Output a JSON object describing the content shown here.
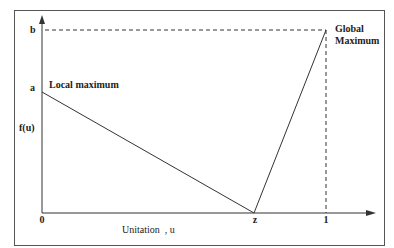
{
  "diagram": {
    "type": "fitness-landscape",
    "y_axis": {
      "label": "f(u)",
      "ticks": [
        {
          "label": "b",
          "value": "b"
        },
        {
          "label": "a",
          "value": "a"
        }
      ]
    },
    "x_axis": {
      "label": "Unitation  , u",
      "ticks": [
        {
          "label": "0",
          "value": 0
        },
        {
          "label": "z",
          "value": "z"
        },
        {
          "label": "1",
          "value": 1
        }
      ]
    },
    "annotations": {
      "local_max": "Local maximum",
      "global_max_line1": "Global",
      "global_max_line2": "Maximum"
    },
    "curve_points": [
      {
        "u": "0",
        "f": "a"
      },
      {
        "u": "z",
        "f": "0"
      },
      {
        "u": "1",
        "f": "b"
      }
    ],
    "colors": {
      "line": "#333333",
      "frame": "#555555"
    }
  }
}
